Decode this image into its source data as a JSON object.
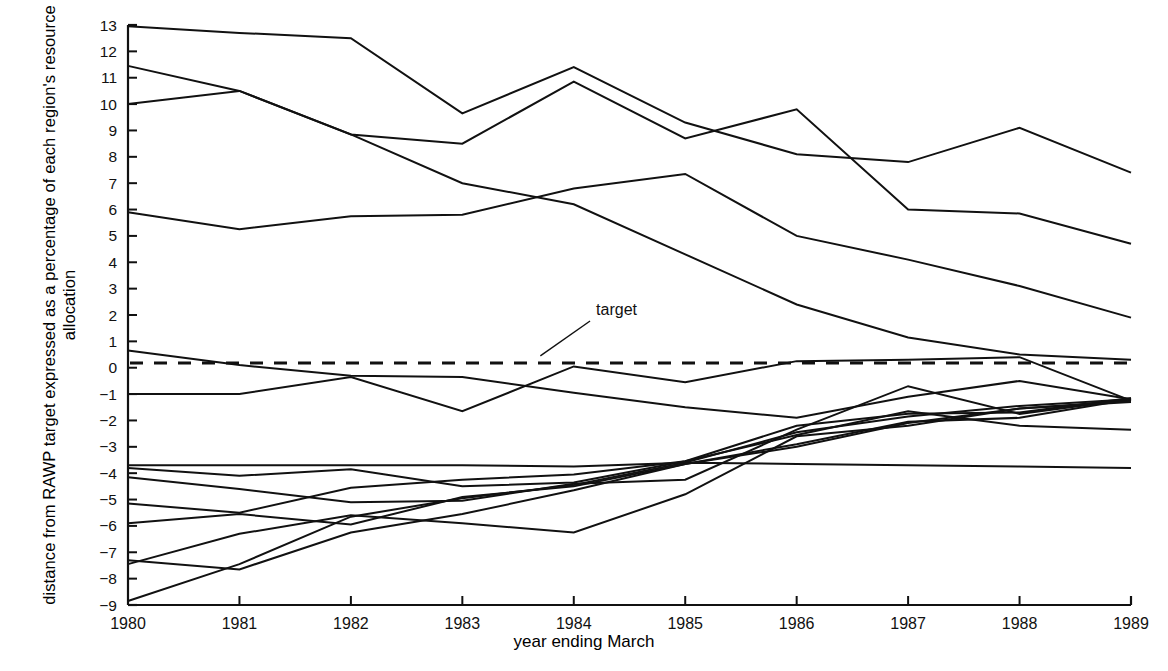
{
  "chart_data": {
    "type": "line",
    "title": "",
    "xlabel": "year ending March",
    "ylabel": "distance from RAWP target expressed as a percentage of each region's resource allocation",
    "x": [
      1980,
      1981,
      1982,
      1983,
      1984,
      1985,
      1986,
      1987,
      1988,
      1989
    ],
    "xticklabels": [
      "1980",
      "1981",
      "1982",
      "1983",
      "1984",
      "1985",
      "1986",
      "1987",
      "1988",
      "1989"
    ],
    "yticklabels": [
      "13",
      "12",
      "11",
      "10",
      "9",
      "8",
      "7",
      "6",
      "5",
      "4",
      "3",
      "2",
      "1",
      "0",
      "-1",
      "-2",
      "-3",
      "-4",
      "-5",
      "-6",
      "-7",
      "-8",
      "-9"
    ],
    "ylim": [
      -9,
      13
    ],
    "xlim": [
      1980,
      1989
    ],
    "grid": false,
    "legend": false,
    "line_color": "#111111",
    "annotations": [
      {
        "text": "target",
        "x": 1984.2,
        "y": 2.0,
        "leader_to_x": 1983.7,
        "leader_to_y": 0.45
      }
    ],
    "target_line": {
      "label": "target",
      "value": 0.18,
      "style": "dashed"
    },
    "series": [
      {
        "name": "region-a",
        "values": [
          12.95,
          12.7,
          12.5,
          9.65,
          11.4,
          9.3,
          8.1,
          7.8,
          9.1,
          7.4
        ]
      },
      {
        "name": "region-b",
        "values": [
          11.45,
          10.5,
          8.85,
          8.5,
          10.85,
          8.7,
          9.8,
          6.0,
          5.85,
          4.7
        ]
      },
      {
        "name": "region-c",
        "values": [
          10.0,
          10.5,
          8.85,
          7.0,
          6.2,
          4.3,
          2.4,
          1.15,
          0.5,
          0.3
        ]
      },
      {
        "name": "region-d",
        "values": [
          5.9,
          5.25,
          5.75,
          5.8,
          6.8,
          7.35,
          5.0,
          4.1,
          3.1,
          1.9
        ]
      },
      {
        "name": "region-e",
        "values": [
          0.65,
          0.1,
          -0.3,
          -0.35,
          -0.95,
          -1.5,
          -1.9,
          -1.1,
          -0.5,
          -1.2
        ]
      },
      {
        "name": "region-f",
        "values": [
          -1.0,
          -1.0,
          -0.35,
          -1.65,
          0.05,
          -0.55,
          0.25,
          0.3,
          0.4,
          -1.25
        ]
      },
      {
        "name": "region-g",
        "values": [
          -3.7,
          -3.7,
          -3.7,
          -3.7,
          -3.75,
          -3.6,
          -3.65,
          -3.7,
          -3.75,
          -3.8
        ]
      },
      {
        "name": "region-h",
        "values": [
          -3.8,
          -4.1,
          -3.85,
          -4.5,
          -4.35,
          -3.55,
          -2.2,
          -1.75,
          -1.7,
          -1.15
        ]
      },
      {
        "name": "region-i",
        "values": [
          -4.15,
          -4.6,
          -5.1,
          -5.05,
          -4.4,
          -4.25,
          -2.35,
          -0.7,
          -1.75,
          -1.2
        ]
      },
      {
        "name": "region-j",
        "values": [
          -5.15,
          -5.5,
          -4.55,
          -4.25,
          -4.05,
          -3.55,
          -2.55,
          -1.65,
          -2.2,
          -2.35
        ]
      },
      {
        "name": "region-k",
        "values": [
          -5.9,
          -5.55,
          -5.95,
          -4.9,
          -4.5,
          -3.65,
          -2.9,
          -2.05,
          -1.9,
          -1.2
        ]
      },
      {
        "name": "region-l",
        "values": [
          -7.3,
          -7.65,
          -6.25,
          -5.55,
          -4.65,
          -3.65,
          -3.0,
          -2.1,
          -1.55,
          -1.3
        ]
      },
      {
        "name": "region-m",
        "values": [
          -7.45,
          -6.3,
          -5.6,
          -5.9,
          -6.25,
          -4.8,
          -2.6,
          -2.2,
          -1.55,
          -1.25
        ]
      },
      {
        "name": "region-n",
        "values": [
          -8.85,
          -7.45,
          -5.65,
          -4.95,
          -4.45,
          -3.6,
          -2.45,
          -1.85,
          -1.45,
          -1.2
        ]
      }
    ]
  },
  "axes": {
    "y_axis_name": "y-axis",
    "x_axis_name": "x-axis"
  }
}
